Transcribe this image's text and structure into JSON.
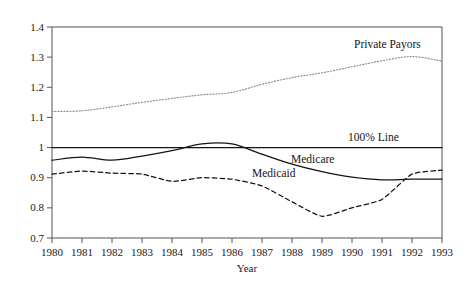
{
  "chart_data": {
    "type": "line",
    "title": "",
    "xlabel": "Year",
    "ylabel": "",
    "xlim": [
      1980,
      1993
    ],
    "ylim": [
      0.7,
      1.4
    ],
    "grid": false,
    "legend_position": "inline-annotations",
    "x": [
      1980,
      1981,
      1982,
      1983,
      1984,
      1985,
      1986,
      1987,
      1988,
      1989,
      1990,
      1991,
      1992,
      1993
    ],
    "xtick_labels": [
      "1980",
      "1981",
      "1982",
      "1983",
      "1984",
      "1985",
      "1986",
      "1987",
      "1988",
      "1989",
      "1990",
      "1991",
      "1992",
      "1993"
    ],
    "ytick_values": [
      0.7,
      0.8,
      0.9,
      1.0,
      1.1,
      1.2,
      1.3,
      1.4
    ],
    "ytick_labels": [
      "0.7",
      "0.8",
      "0.9",
      "1",
      "1.1",
      "1.2",
      "1.3",
      "1.4"
    ],
    "series": [
      {
        "name": "Private Payors",
        "style": "dotted",
        "color": "#8a8a8a",
        "label_x": 1990.1,
        "label_y": 1.345,
        "values": [
          1.12,
          1.122,
          1.135,
          1.15,
          1.163,
          1.175,
          1.183,
          1.21,
          1.232,
          1.248,
          1.268,
          1.288,
          1.302,
          1.287
        ]
      },
      {
        "name": "Medicare",
        "style": "solid",
        "color": "#141414",
        "label_x": 1988.0,
        "label_y": 0.962,
        "values": [
          0.958,
          0.968,
          0.958,
          0.972,
          0.99,
          1.012,
          1.012,
          0.978,
          0.945,
          0.92,
          0.902,
          0.893,
          0.895,
          0.895
        ]
      },
      {
        "name": "Medicaid",
        "style": "dashed",
        "color": "#141414",
        "label_x": 1986.7,
        "label_y": 0.915,
        "values": [
          0.912,
          0.922,
          0.915,
          0.912,
          0.888,
          0.9,
          0.895,
          0.873,
          0.82,
          0.772,
          0.8,
          0.828,
          0.912,
          0.925
        ]
      },
      {
        "name": "100% Line",
        "style": "solid-reference",
        "color": "#141414",
        "label_x": 1989.9,
        "label_y": 1.035,
        "constant": 1.0
      }
    ],
    "annotations": [
      {
        "text": "Private Payors"
      },
      {
        "text": "100% Line"
      },
      {
        "text": "Medicare"
      },
      {
        "text": "Medicaid"
      }
    ]
  },
  "axes": {
    "x_title": "Year"
  }
}
